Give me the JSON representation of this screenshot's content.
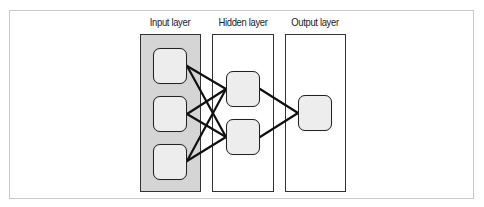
{
  "diagram": {
    "type": "neural-network",
    "layers": [
      {
        "id": "input",
        "label": "Input layer",
        "node_count": 3,
        "fill": "#d5d5d5"
      },
      {
        "id": "hidden",
        "label": "Hidden layer",
        "node_count": 2,
        "fill": "#ffffff"
      },
      {
        "id": "output",
        "label": "Output layer",
        "node_count": 1,
        "fill": "#ffffff"
      }
    ],
    "connections": [
      {
        "from": "input-1",
        "to": "hidden-1"
      },
      {
        "from": "input-1",
        "to": "hidden-2"
      },
      {
        "from": "input-2",
        "to": "hidden-1"
      },
      {
        "from": "input-2",
        "to": "hidden-2"
      },
      {
        "from": "input-3",
        "to": "hidden-1"
      },
      {
        "from": "input-3",
        "to": "hidden-2"
      },
      {
        "from": "hidden-1",
        "to": "output-1"
      },
      {
        "from": "hidden-2",
        "to": "output-1"
      }
    ],
    "colors": {
      "node_fill": "#ededed",
      "node_border": "#222222",
      "edge": "#111111",
      "frame_border": "#c9c9c9"
    }
  }
}
